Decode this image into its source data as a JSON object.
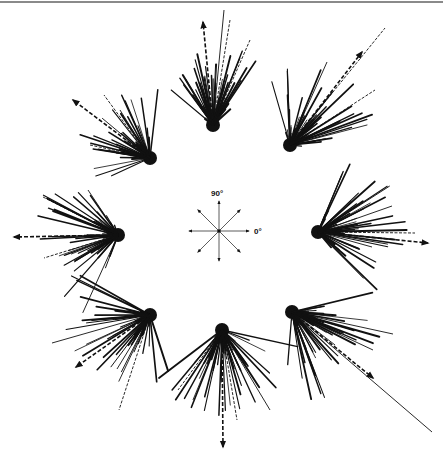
{
  "figure": {
    "stroke_color": "#111111",
    "background": "#ffffff"
  },
  "compass": {
    "center": [
      219,
      231
    ],
    "radius": 30,
    "directions_deg": [
      0,
      45,
      90,
      135,
      180,
      225,
      270,
      315
    ],
    "label_90": "90°",
    "label_0": "0°"
  },
  "clusters": [
    {
      "name": "north",
      "center": [
        213,
        125
      ],
      "mean_deg": 95,
      "spread": 70,
      "max_len": 70,
      "count": 60,
      "arrow_end": [
        203,
        22
      ],
      "extras": [
        [
          224,
          10
        ],
        [
          230,
          20
        ],
        [
          250,
          40
        ]
      ]
    },
    {
      "name": "north-east",
      "center": [
        290,
        145
      ],
      "mean_deg": 50,
      "spread": 65,
      "max_len": 80,
      "count": 60,
      "arrow_end": [
        362,
        52
      ],
      "extras": [
        [
          385,
          28
        ],
        [
          375,
          90
        ],
        [
          327,
          62
        ]
      ]
    },
    {
      "name": "east",
      "center": [
        318,
        232
      ],
      "mean_deg": 5,
      "spread": 80,
      "max_len": 80,
      "count": 60,
      "arrow_end": [
        428,
        243
      ],
      "extras": [
        [
          415,
          233
        ],
        [
          392,
          206
        ],
        [
          372,
          247
        ]
      ]
    },
    {
      "name": "south-east",
      "center": [
        292,
        312
      ],
      "mean_deg": -35,
      "spread": 70,
      "max_len": 85,
      "count": 60,
      "arrow_end": [
        373,
        378
      ],
      "extras": [
        [
          432,
          432
        ],
        [
          393,
          334
        ],
        [
          373,
          350
        ]
      ]
    },
    {
      "name": "south",
      "center": [
        222,
        330
      ],
      "mean_deg": -85,
      "spread": 80,
      "max_len": 80,
      "count": 60,
      "arrow_end": [
        223,
        447
      ],
      "extras": [
        [
          270,
          410
        ],
        [
          178,
          390
        ],
        [
          237,
          420
        ]
      ]
    },
    {
      "name": "south-west",
      "center": [
        150,
        315
      ],
      "mean_deg": -145,
      "spread": 75,
      "max_len": 80,
      "count": 60,
      "arrow_end": [
        76,
        367
      ],
      "extras": [
        [
          52,
          343
        ],
        [
          119,
          410
        ],
        [
          117,
          369
        ]
      ]
    },
    {
      "name": "west",
      "center": [
        118,
        235
      ],
      "mean_deg": 178,
      "spread": 80,
      "max_len": 80,
      "count": 60,
      "arrow_end": [
        14,
        237
      ],
      "extras": [
        [
          43,
          197
        ],
        [
          44,
          258
        ],
        [
          88,
          190
        ]
      ]
    },
    {
      "name": "north-west",
      "center": [
        150,
        158
      ],
      "mean_deg": 140,
      "spread": 70,
      "max_len": 65,
      "count": 55,
      "arrow_end": [
        73,
        100
      ],
      "extras": [
        [
          104,
          95
        ],
        [
          120,
          110
        ],
        [
          90,
          145
        ]
      ]
    }
  ]
}
